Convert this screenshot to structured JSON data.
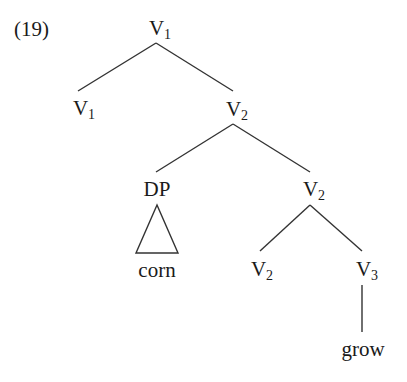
{
  "example_number": "(19)",
  "line_color": "#333333",
  "nodes": {
    "root": {
      "cat": "V",
      "sub": "1"
    },
    "v1_left": {
      "cat": "V",
      "sub": "1"
    },
    "v2_mid": {
      "cat": "V",
      "sub": "2"
    },
    "dp": {
      "cat": "DP",
      "sub": ""
    },
    "corn": {
      "cat": "corn",
      "sub": ""
    },
    "v2_low": {
      "cat": "V",
      "sub": "2"
    },
    "v2_leaf": {
      "cat": "V",
      "sub": "2"
    },
    "v3": {
      "cat": "V",
      "sub": "3"
    },
    "grow": {
      "cat": "grow",
      "sub": ""
    }
  },
  "edges": [
    {
      "from": "V1",
      "to": "V1"
    },
    {
      "from": "V1",
      "to": "V2"
    },
    {
      "from": "V2",
      "to": "DP"
    },
    {
      "from": "V2",
      "to": "V2"
    },
    {
      "from": "V2",
      "to": "V2"
    },
    {
      "from": "V2",
      "to": "V3"
    },
    {
      "from": "V3",
      "to": "grow"
    }
  ],
  "triangle": {
    "over": "DP",
    "covers": "corn"
  }
}
